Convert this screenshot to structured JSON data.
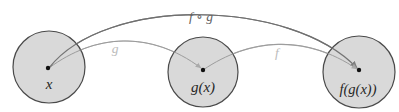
{
  "figure": {
    "background_color": "#ffffff"
  },
  "sets": [
    {
      "id": "domain",
      "name": "x-set",
      "label": "x",
      "label_parts": [
        "x"
      ],
      "center_x": 49,
      "center_y": 67,
      "radius": 36,
      "fill_color": "#d9d9d9",
      "stroke_color": "#4a4a4a",
      "point": {
        "x": 48,
        "y": 68,
        "color": "#111111",
        "radius": 2.2
      },
      "label_x": 49,
      "label_y": 84
    },
    {
      "id": "intermediate",
      "name": "gx-set",
      "label": "g(x)",
      "label_parts": [
        "g",
        "(",
        "x",
        ")"
      ],
      "center_x": 203,
      "center_y": 72,
      "radius": 35,
      "fill_color": "#d9d9d9",
      "stroke_color": "#4a4a4a",
      "point": {
        "x": 203,
        "y": 70,
        "color": "#111111",
        "radius": 2.2
      },
      "label_x": 203,
      "label_y": 87
    },
    {
      "id": "codomain",
      "name": "fgx-set",
      "label": "f(g(x))",
      "label_parts": [
        "f",
        "(",
        "g",
        "(",
        "x",
        ")",
        ")"
      ],
      "center_x": 359,
      "center_y": 72,
      "radius": 36,
      "fill_color": "#d9d9d9",
      "stroke_color": "#4a4a4a",
      "point": {
        "x": 359,
        "y": 70,
        "color": "#111111",
        "radius": 2.2
      },
      "label_x": 358,
      "label_y": 89
    }
  ],
  "arrows": [
    {
      "id": "g-map",
      "name": "arrow-g",
      "label": "g",
      "label_x": 115,
      "label_y": 49,
      "label_style": "faded",
      "color": "#b4b4b4",
      "stroke_width": 1.1,
      "from": "x",
      "to": "g(x)",
      "path": "M 49 68 C 95 34 150 30 201 68"
    },
    {
      "id": "f-map",
      "name": "arrow-f",
      "label": "f",
      "label_x": 277,
      "label_y": 53,
      "label_style": "faded",
      "color": "#b4b4b4",
      "stroke_width": 1.1,
      "from": "g(x)",
      "to": "f(g(x))",
      "path": "M 203 70 C 250 38 305 34 357 69"
    },
    {
      "id": "fog-map",
      "name": "arrow-f-compose-g",
      "label": "f ∘ g",
      "label_x": 201,
      "label_y": 17,
      "label_style": "primary",
      "color": "#7a7a7a",
      "stroke_width": 1.2,
      "from": "x",
      "to": "f(g(x))",
      "path": "M 49 68 C 105 -4 290 -2 357 68"
    }
  ],
  "colors": {
    "set_fill": "#d9d9d9",
    "set_stroke": "#4a4a4a",
    "arrow_dark": "#7a7a7a",
    "arrow_light": "#b4b4b4",
    "point": "#111111",
    "text": "#262626",
    "text_faded": "#bcbcbc"
  }
}
